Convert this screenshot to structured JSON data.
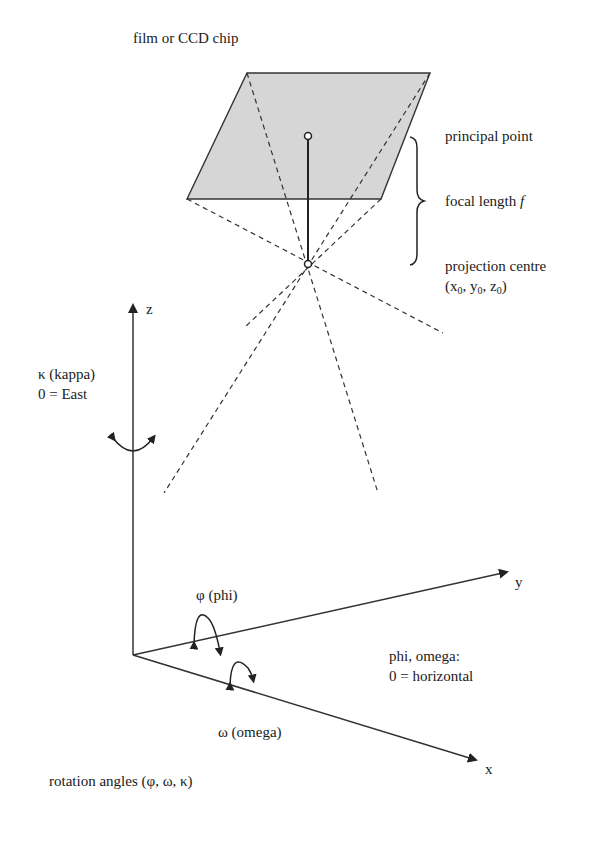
{
  "diagram": {
    "type": "camera-orientation-geometry",
    "colors": {
      "stroke": "#222222",
      "film_fill": "#d6d6d6",
      "background": "#ffffff"
    },
    "labels": {
      "film": "film or CCD chip",
      "principal_point": "principal point",
      "focal_length": "focal length ",
      "focal_symbol": "f",
      "projection_centre": "projection centre",
      "coords_open": "(x",
      "coords_sub0": "0",
      "coords_y": ", y",
      "coords_sub1": "0",
      "coords_z": ", z",
      "coords_sub2": "0",
      "coords_close": ")",
      "axis_z": "z",
      "axis_y": "y",
      "axis_x": "x",
      "kappa": "κ (kappa)",
      "kappa_zero": "0 = East",
      "phi": "φ (phi)",
      "omega": "ω (omega)",
      "phi_omega": "phi, omega:",
      "phi_omega_zero": "0 = horizontal",
      "rotation_angles": "rotation angles (φ, ω, κ)"
    }
  }
}
